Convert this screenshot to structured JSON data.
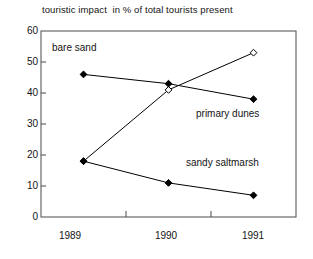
{
  "chart_data": {
    "type": "line",
    "title": "touristic impact  in % of total tourists present",
    "xlabel": "",
    "ylabel": "",
    "categories": [
      "1989",
      "1990",
      "1991"
    ],
    "x": [
      1989,
      1990,
      1991
    ],
    "xlim": [
      1988.5,
      1991.5
    ],
    "ylim": [
      0,
      60
    ],
    "yticks": [
      0,
      10,
      20,
      30,
      40,
      50,
      60
    ],
    "ytick_labels": [
      "0",
      "10",
      "20",
      "30",
      "40",
      "50",
      "60"
    ],
    "xtick_labels": [
      "1989",
      "1990",
      "1991"
    ],
    "grid": false,
    "legend_position": "inline-annotations",
    "series": [
      {
        "name": "bare sand",
        "values": [
          18,
          41,
          53
        ],
        "marker": "open-diamond",
        "color": "#000000"
      },
      {
        "name": "primary dunes",
        "values": [
          46,
          43,
          38
        ],
        "marker": "filled-diamond",
        "color": "#000000"
      },
      {
        "name": "sandy saltmarsh",
        "values": [
          18,
          11,
          7
        ],
        "marker": "filled-diamond",
        "color": "#000000"
      }
    ],
    "annotations": [
      {
        "text": "bare sand",
        "x_px": 52,
        "y_px": 48
      },
      {
        "text": "primary dunes",
        "x_px": 196,
        "y_px": 114
      },
      {
        "text": "sandy saltmarsh",
        "x_px": 186,
        "y_px": 163
      }
    ]
  },
  "axes": {
    "frame_color": "#4a4a4a",
    "line_color": "#000000"
  }
}
